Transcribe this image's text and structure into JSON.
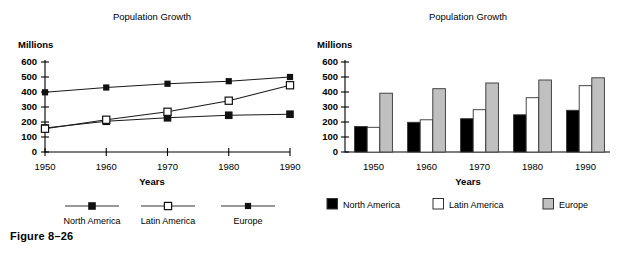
{
  "figure": {
    "caption": "Figure 8–26"
  },
  "chart_data": [
    {
      "id": "line-chart",
      "type": "line",
      "title": "Population Growth",
      "xlabel": "Years",
      "ylabel": "Millions",
      "categories": [
        "1950",
        "1960",
        "1970",
        "1980",
        "1990"
      ],
      "ylim": [
        0,
        600
      ],
      "yticks": [
        "0",
        "100",
        "200",
        "300",
        "400",
        "500",
        "600"
      ],
      "grid": false,
      "legend_position": "bottom",
      "series": [
        {
          "name": "North America",
          "marker": "filled-square",
          "values": [
            160,
            205,
            228,
            245,
            252
          ]
        },
        {
          "name": "Latin America",
          "marker": "open-square",
          "values": [
            155,
            215,
            268,
            342,
            445
          ]
        },
        {
          "name": "Europe",
          "marker": "filled-square-small",
          "values": [
            398,
            430,
            455,
            472,
            500
          ]
        }
      ]
    },
    {
      "id": "bar-chart",
      "type": "bar",
      "title": "Population Growth",
      "xlabel": "Years",
      "ylabel": "Millions",
      "categories": [
        "1950",
        "1960",
        "1970",
        "1980",
        "1990"
      ],
      "ylim": [
        0,
        600
      ],
      "yticks": [
        "0",
        "100",
        "200",
        "300",
        "400",
        "500",
        "600"
      ],
      "grid": false,
      "legend_position": "bottom",
      "series": [
        {
          "name": "North America",
          "color": "#000000",
          "values": [
            170,
            198,
            222,
            248,
            278
          ]
        },
        {
          "name": "Latin America",
          "color": "#ffffff",
          "values": [
            165,
            215,
            282,
            362,
            442
          ]
        },
        {
          "name": "Europe",
          "color": "#c0c0c0",
          "values": [
            392,
            422,
            460,
            480,
            495
          ]
        }
      ]
    }
  ]
}
